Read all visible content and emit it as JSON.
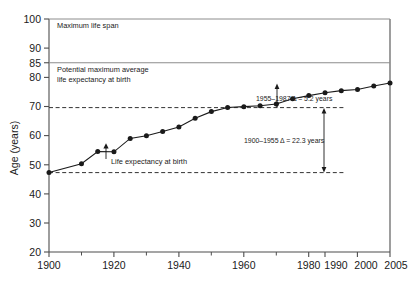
{
  "chart_data": {
    "type": "line",
    "title": "",
    "xlabel": "",
    "ylabel": "Age (years)",
    "xlim": [
      1900,
      2005
    ],
    "ylim": [
      20,
      100
    ],
    "grid": false,
    "legend": "none",
    "x_ticks": [
      1900,
      1920,
      1940,
      1960,
      1980,
      1990,
      2000,
      2005
    ],
    "x_tick_labels": [
      "1900",
      "1920",
      "1940",
      "1960",
      "1980",
      "1990",
      "2000",
      "2005"
    ],
    "x_minor_ticks": [
      1910,
      1930,
      1950,
      1970
    ],
    "y_ticks": [
      20,
      30,
      40,
      50,
      60,
      70,
      80,
      85,
      90,
      100
    ],
    "y_tick_labels": [
      "20",
      "30",
      "40",
      "50",
      "60",
      "70",
      "80",
      "85",
      "90",
      "100"
    ],
    "series": [
      {
        "name": "Life expectancy at birth",
        "x": [
          1900,
          1910,
          1915,
          1920,
          1925,
          1930,
          1935,
          1940,
          1945,
          1950,
          1955,
          1960,
          1965,
          1970,
          1975,
          1980,
          1985,
          1990,
          1995,
          2000,
          2005
        ],
        "values": [
          47.3,
          50.3,
          54.5,
          54.4,
          59.0,
          59.9,
          61.4,
          62.9,
          65.9,
          68.2,
          69.6,
          69.9,
          70.2,
          70.8,
          72.6,
          73.7,
          74.7,
          75.4,
          75.8,
          77.0,
          78.0
        ]
      }
    ],
    "reference_lines": [
      {
        "name": "maximum-life-span",
        "y": 100,
        "label": "Maximum life span",
        "style": "solid"
      },
      {
        "name": "potential-maximum-average-life-expectancy",
        "y": 85,
        "label": "Potential maximum average\nlife expectancy at birth",
        "style": "solid"
      },
      {
        "name": "baseline-1900",
        "y": 47.3,
        "label": "",
        "style": "dashed"
      },
      {
        "name": "baseline-1955",
        "y": 69.6,
        "label": "",
        "style": "dashed"
      }
    ],
    "annotations": [
      {
        "name": "maximum-life-span-label",
        "text": "Maximum life span"
      },
      {
        "name": "potential-max-line1",
        "text": "Potential maximum average"
      },
      {
        "name": "potential-max-line2",
        "text": "life expectancy at birth"
      },
      {
        "name": "series-callout",
        "text": "Life expectancy at birth"
      },
      {
        "name": "delta-1955-1987",
        "text": "1955–1987  Δ = 5.2 years",
        "value": 5.2,
        "period": "1955–1987"
      },
      {
        "name": "delta-1900-1955",
        "text": "1900–1955  Δ = 22.3 years",
        "value": 22.3,
        "period": "1900–1955"
      }
    ],
    "colors": {
      "line": "#1a1a1a",
      "marker": "#1a1a1a",
      "axis": "#4d4d4d",
      "reference": "#808080",
      "background": "#ffffff"
    }
  }
}
